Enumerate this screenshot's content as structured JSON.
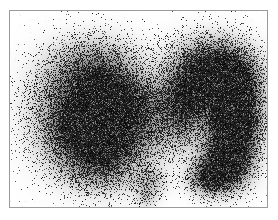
{
  "image": {
    "modality": "thyroid-scintigraphy",
    "title": "Thyroid Scintigraphy Scan",
    "background_color": "#ffffff",
    "frame": {
      "visible": true,
      "border_color": "#9a9a9a",
      "border_width_px": 1,
      "x": 9,
      "y": 10,
      "width": 259,
      "height": 198
    },
    "canvas": {
      "width": 257,
      "height": 196
    },
    "grain": {
      "description": "photon-count speckle noise",
      "dot_count": 120000,
      "dot_size_px": 1,
      "seed": 20240517
    },
    "intensity_scale": {
      "min_color": "#ffffff",
      "max_color": "#000000",
      "description": "grayscale uptake, darker = higher radiotracer uptake"
    },
    "structures": [
      {
        "name": "left-lobe",
        "label": "Left lobe (viewer left)",
        "uptake": "moderate",
        "peak_intensity": 0.62,
        "blobs": [
          {
            "cx": 80,
            "cy": 60,
            "rx": 46,
            "ry": 34,
            "amp": 0.58
          },
          {
            "cx": 72,
            "cy": 95,
            "rx": 50,
            "ry": 40,
            "amp": 0.64
          },
          {
            "cx": 78,
            "cy": 130,
            "rx": 48,
            "ry": 38,
            "amp": 0.6
          },
          {
            "cx": 92,
            "cy": 152,
            "rx": 40,
            "ry": 30,
            "amp": 0.5
          },
          {
            "cx": 108,
            "cy": 95,
            "rx": 34,
            "ry": 46,
            "amp": 0.46
          },
          {
            "cx": 62,
            "cy": 115,
            "rx": 24,
            "ry": 24,
            "amp": 0.3
          },
          {
            "cx": 140,
            "cy": 170,
            "rx": 18,
            "ry": 16,
            "amp": 0.34
          },
          {
            "cx": 136,
            "cy": 186,
            "rx": 11,
            "ry": 12,
            "amp": 0.26
          }
        ]
      },
      {
        "name": "right-lobe",
        "label": "Right lobe (viewer right)",
        "uptake": "intense",
        "peak_intensity": 1.0,
        "blobs": [
          {
            "cx": 196,
            "cy": 58,
            "rx": 40,
            "ry": 32,
            "amp": 0.72
          },
          {
            "cx": 216,
            "cy": 70,
            "rx": 34,
            "ry": 34,
            "amp": 0.88
          },
          {
            "cx": 226,
            "cy": 100,
            "rx": 26,
            "ry": 38,
            "amp": 1.0
          },
          {
            "cx": 222,
            "cy": 134,
            "rx": 25,
            "ry": 34,
            "amp": 1.0
          },
          {
            "cx": 210,
            "cy": 158,
            "rx": 26,
            "ry": 24,
            "amp": 0.8
          },
          {
            "cx": 196,
            "cy": 168,
            "rx": 20,
            "ry": 16,
            "amp": 0.52
          },
          {
            "cx": 178,
            "cy": 80,
            "rx": 26,
            "ry": 30,
            "amp": 0.46
          },
          {
            "cx": 174,
            "cy": 110,
            "rx": 22,
            "ry": 26,
            "amp": 0.34
          }
        ]
      },
      {
        "name": "isthmus",
        "label": "Isthmus",
        "uptake": "low",
        "peak_intensity": 0.3,
        "blobs": [
          {
            "cx": 140,
            "cy": 86,
            "rx": 42,
            "ry": 20,
            "amp": 0.34
          },
          {
            "cx": 152,
            "cy": 104,
            "rx": 46,
            "ry": 20,
            "amp": 0.26
          },
          {
            "cx": 130,
            "cy": 120,
            "rx": 44,
            "ry": 22,
            "amp": 0.22
          },
          {
            "cx": 150,
            "cy": 135,
            "rx": 40,
            "ry": 20,
            "amp": 0.16
          }
        ]
      },
      {
        "name": "superior-notch",
        "label": "Suprasternal notch (photopenic)",
        "uptake": "none",
        "peak_intensity": 0.0,
        "blobs": []
      }
    ]
  }
}
